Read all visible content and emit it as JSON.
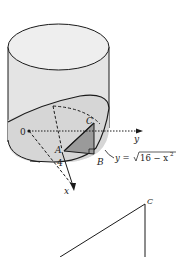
{
  "figure": {
    "labels": {
      "origin": "0",
      "point_a": "A",
      "point_b": "B",
      "point_c": "C",
      "x_axis": "x",
      "y_axis": "y",
      "radius": "4",
      "curve_eq_prefix": "y = ",
      "curve_eq_radical": "16 − x",
      "curve_eq_exp": "2",
      "bottom_point_c": "C"
    },
    "colors": {
      "stroke": "#1a1a1a",
      "cylinder_fill": "#e6e6e6",
      "top_fill": "#eeeeee",
      "wedge_fill": "#d0d0d0",
      "triangle_fill": "#9a9a9a"
    }
  }
}
